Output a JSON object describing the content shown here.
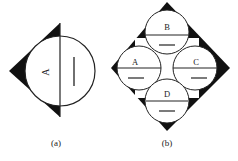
{
  "figure": {
    "panels": [
      {
        "id": "a",
        "caption": "(a)",
        "circle_label": "A",
        "shape": "triangle-with-circle"
      },
      {
        "id": "b",
        "caption": "(b)",
        "circles": [
          {
            "label": "B",
            "position": "top"
          },
          {
            "label": "A",
            "position": "left"
          },
          {
            "label": "C",
            "position": "right"
          },
          {
            "label": "D",
            "position": "bottom"
          }
        ],
        "shape": "diamond-with-four-circles"
      }
    ],
    "colors": {
      "fill": "#111111",
      "background": "#ffffff",
      "stroke": "#222222"
    }
  }
}
